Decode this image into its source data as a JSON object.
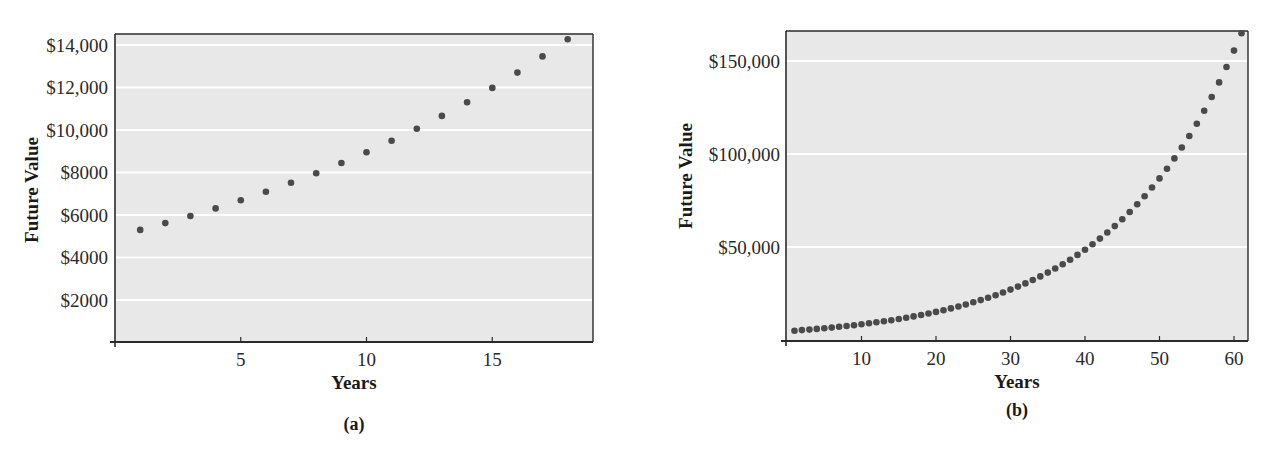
{
  "colors": {
    "plot_background": "#e8e8e8",
    "gridline": "#ffffff",
    "axis": "#2b2b2b",
    "point": "#4a4a4a"
  },
  "chart_data": [
    {
      "type": "scatter",
      "panel_label": "(a)",
      "title": "",
      "xlabel": "Years",
      "ylabel": "Future Value",
      "xlim": [
        0,
        19
      ],
      "ylim": [
        0,
        14500
      ],
      "grid": true,
      "legend": null,
      "xticks": [
        5,
        10,
        15
      ],
      "xtick_labels": [
        "5",
        "10",
        "15"
      ],
      "yticks": [
        2000,
        4000,
        6000,
        8000,
        10000,
        12000,
        14000
      ],
      "ytick_labels": [
        "$2000",
        "$4000",
        "$6000",
        "$8000",
        "$10,000",
        "$12,000",
        "$14,000"
      ],
      "x": [
        1,
        2,
        3,
        4,
        5,
        6,
        7,
        8,
        9,
        10,
        11,
        12,
        13,
        14,
        15,
        16,
        17,
        18
      ],
      "y": [
        5300,
        5618,
        5955,
        6312,
        6691,
        7093,
        7518,
        7969,
        8447,
        8954,
        9491,
        10061,
        10665,
        11305,
        11983,
        12702,
        13464,
        14272
      ]
    },
    {
      "type": "scatter",
      "panel_label": "(b)",
      "title": "",
      "xlabel": "Years",
      "ylabel": "Future Value",
      "xlim": [
        0,
        62
      ],
      "ylim": [
        -2500,
        166000
      ],
      "grid": true,
      "legend": null,
      "xticks": [
        10,
        20,
        30,
        40,
        50,
        60
      ],
      "xtick_labels": [
        "10",
        "20",
        "30",
        "40",
        "50",
        "60"
      ],
      "yticks": [
        50000,
        100000,
        150000
      ],
      "ytick_labels": [
        "$50,000",
        "$100,000",
        "$150,000"
      ],
      "x": [
        1,
        2,
        3,
        4,
        5,
        6,
        7,
        8,
        9,
        10,
        11,
        12,
        13,
        14,
        15,
        16,
        17,
        18,
        19,
        20,
        21,
        22,
        23,
        24,
        25,
        26,
        27,
        28,
        29,
        30,
        31,
        32,
        33,
        34,
        35,
        36,
        37,
        38,
        39,
        40,
        41,
        42,
        43,
        44,
        45,
        46,
        47,
        48,
        49,
        50,
        51,
        52,
        53,
        54,
        55,
        56,
        57,
        58,
        59,
        60,
        61
      ],
      "y": [
        5000,
        5300,
        5618,
        5955,
        6312,
        6691,
        7093,
        7518,
        7969,
        8447,
        8954,
        9491,
        10061,
        10665,
        11305,
        11983,
        12702,
        13464,
        14272,
        15128,
        16036,
        16998,
        18018,
        19099,
        20245,
        21459,
        22747,
        24112,
        25558,
        27092,
        28717,
        30440,
        32267,
        34203,
        36255,
        38430,
        40736,
        43180,
        45771,
        48517,
        51429,
        54514,
        57785,
        61252,
        64928,
        68823,
        72953,
        77330,
        81970,
        86888,
        92101,
        97627,
        103485,
        109694,
        116276,
        123252,
        130648,
        138486,
        146796,
        155603,
        164939
      ]
    }
  ]
}
